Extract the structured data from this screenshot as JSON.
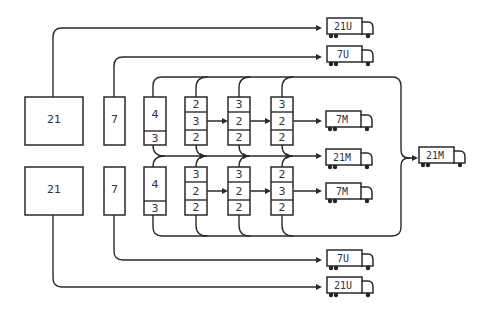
{
  "colors": {
    "stroke": "#2a2a2a",
    "text": "#333333",
    "background": "#ffffff"
  },
  "source_blocks": [
    {
      "label": "21",
      "x": 25,
      "y": 97,
      "w": 58,
      "h": 48
    },
    {
      "label": "7",
      "x": 104,
      "y": 97,
      "w": 21,
      "h": 48
    },
    {
      "label": "21",
      "x": 25,
      "y": 167,
      "w": 58,
      "h": 48
    },
    {
      "label": "7",
      "x": 104,
      "y": 167,
      "w": 21,
      "h": 48
    }
  ],
  "stack_rows": [
    {
      "row": "top",
      "y": 97,
      "stacks": [
        {
          "x": 144,
          "cells": [
            "4",
            "3"
          ],
          "split": [
            34,
            14
          ]
        },
        {
          "x": 185,
          "cells": [
            "2",
            "3",
            "2"
          ],
          "split": [
            15,
            18,
            15
          ]
        },
        {
          "x": 228,
          "cells": [
            "3",
            "2",
            "2"
          ],
          "split": [
            15,
            18,
            15
          ]
        },
        {
          "x": 271,
          "cells": [
            "3",
            "2",
            "2"
          ],
          "split": [
            15,
            18,
            15
          ]
        }
      ]
    },
    {
      "row": "bottom",
      "y": 167,
      "stacks": [
        {
          "x": 144,
          "cells": [
            "4",
            "3"
          ],
          "split": [
            34,
            14
          ]
        },
        {
          "x": 185,
          "cells": [
            "3",
            "2",
            "2"
          ],
          "split": [
            15,
            18,
            15
          ]
        },
        {
          "x": 228,
          "cells": [
            "3",
            "2",
            "2"
          ],
          "split": [
            15,
            18,
            15
          ]
        },
        {
          "x": 271,
          "cells": [
            "2",
            "3",
            "2"
          ],
          "split": [
            15,
            18,
            15
          ]
        }
      ]
    }
  ],
  "trucks": [
    {
      "id": "truck-21u-top",
      "label": "21U",
      "x": 327,
      "y": 18
    },
    {
      "id": "truck-7u-top",
      "label": "7U",
      "x": 327,
      "y": 46
    },
    {
      "id": "truck-7m-top",
      "label": "7M",
      "x": 326,
      "y": 111
    },
    {
      "id": "truck-21m-mid",
      "label": "21M",
      "x": 326,
      "y": 149
    },
    {
      "id": "truck-7m-bottom",
      "label": "7M",
      "x": 326,
      "y": 183
    },
    {
      "id": "truck-7u-bottom",
      "label": "7U",
      "x": 327,
      "y": 250
    },
    {
      "id": "truck-21u-bottom",
      "label": "21U",
      "x": 327,
      "y": 277
    },
    {
      "id": "truck-21m-final",
      "label": "21M",
      "x": 419,
      "y": 147
    }
  ]
}
